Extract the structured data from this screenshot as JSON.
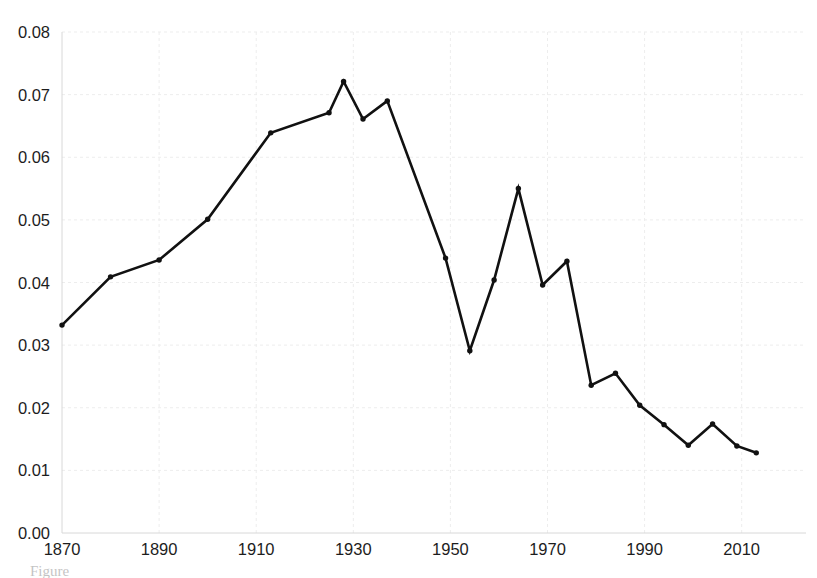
{
  "chart_data": {
    "type": "line",
    "title": "",
    "subtitle": "",
    "xlabel": "",
    "ylabel": "",
    "xlim": [
      1866,
      2018
    ],
    "ylim": [
      0.0,
      0.08
    ],
    "grid": true,
    "legend": null,
    "legend_position": "none",
    "markers": true,
    "line_color": "#111111",
    "marker_color": "#111111",
    "grid_color": "#ededed",
    "background_color": "#ffffff",
    "x": [
      1870,
      1880,
      1890,
      1900,
      1913,
      1925,
      1928,
      1932,
      1937,
      1949,
      1954,
      1959,
      1964,
      1969,
      1974,
      1979,
      1984,
      1989,
      1994,
      1999,
      2004,
      2009,
      2013
    ],
    "values": [
      0.0332,
      0.0409,
      0.0436,
      0.0501,
      0.0639,
      0.0671,
      0.0721,
      0.0661,
      0.069,
      0.0439,
      0.0291,
      0.0404,
      0.055,
      0.0396,
      0.0434,
      0.0236,
      0.0255,
      0.0204,
      0.0173,
      0.014,
      0.0174,
      0.0139,
      0.0128
    ],
    "series": [
      {
        "name": "",
        "x": [
          1870,
          1880,
          1890,
          1900,
          1913,
          1925,
          1928,
          1932,
          1937,
          1949,
          1954,
          1959,
          1964,
          1969,
          1974,
          1979,
          1984,
          1989,
          1994,
          1999,
          2004,
          2009,
          2013
        ],
        "values": [
          0.0332,
          0.0409,
          0.0436,
          0.0501,
          0.0639,
          0.0671,
          0.0721,
          0.0661,
          0.069,
          0.0439,
          0.0291,
          0.0404,
          0.055,
          0.0396,
          0.0434,
          0.0236,
          0.0255,
          0.0204,
          0.0173,
          0.014,
          0.0174,
          0.0139,
          0.0128
        ]
      }
    ],
    "yticks": [
      0.0,
      0.01,
      0.02,
      0.03,
      0.04,
      0.05,
      0.06,
      0.07,
      0.08
    ],
    "ytick_labels": [
      "0.00",
      "0.01",
      "0.02",
      "0.03",
      "0.04",
      "0.05",
      "0.06",
      "0.07",
      "0.08"
    ],
    "xticks": [
      1870,
      1890,
      1910,
      1930,
      1950,
      1970,
      1990,
      2010
    ],
    "xtick_labels": [
      "1870",
      "1890",
      "1910",
      "1930",
      "1950",
      "1970",
      "1990",
      "2010"
    ],
    "annotations": []
  },
  "caption": {
    "text": "Figure"
  }
}
